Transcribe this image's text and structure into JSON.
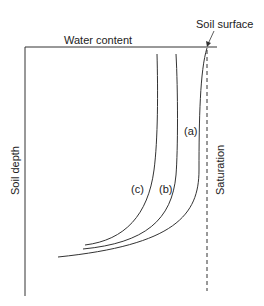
{
  "diagram": {
    "labels": {
      "x_axis": "Water content",
      "y_axis": "Soil depth",
      "surface": "Soil surface",
      "saturation": "Saturation"
    },
    "curves": [
      {
        "id": "a",
        "label": "(a)"
      },
      {
        "id": "b",
        "label": "(b)"
      },
      {
        "id": "c",
        "label": "(c)"
      }
    ],
    "colors": {
      "line": "#333333",
      "text": "#222222",
      "background": "#ffffff"
    }
  }
}
